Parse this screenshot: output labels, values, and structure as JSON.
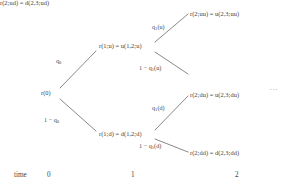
{
  "figure": {
    "type": "binomial-tree-diagram",
    "title": "",
    "ellipsis": "...",
    "nodes": {
      "root": "r(0)",
      "up1": "r(1;u) = u(1,2;u)",
      "down1": "r(1;d) = d(1,2;d)",
      "uu": "r(2;uu) = u(2,3;uu)",
      "ud": "r(2;ud) = d(2,3;ud)",
      "du": "r(2;du) = u(2,3;du)",
      "dd": "r(2;dd) = d(2,3;dd)"
    },
    "probabilities": {
      "root_up": "q",
      "root_up_sub": "0",
      "root_down_prefix": "1 − q",
      "root_down_sub": "0",
      "up_up": "q",
      "up_up_sub": "1",
      "up_up_arg": "(u)",
      "up_down_prefix": "1 − q",
      "up_down_sub": "1",
      "up_down_arg": "(u)",
      "down_up": "q",
      "down_up_sub": "1",
      "down_up_arg": "(d)",
      "down_down_prefix": "1 − q",
      "down_down_sub": "1",
      "down_down_arg": "(d)"
    },
    "time_axis": {
      "caption": "time",
      "ticks": [
        "0",
        "1",
        "2"
      ]
    },
    "colors": {
      "line": "#555555",
      "text": "#3f3f3f",
      "background": "#ffffff"
    }
  }
}
